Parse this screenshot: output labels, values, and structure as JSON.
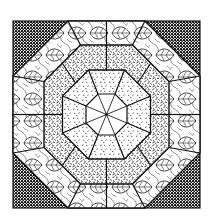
{
  "image": {
    "description": "Black-and-white octagonal quilt block illustration",
    "background": "#ffffff",
    "colors": {
      "ink": "#1a1a1a",
      "corner_fill": "#2b2b2b",
      "paper": "#ffffff"
    },
    "block": {
      "x": 13,
      "y": 21,
      "size": 187,
      "center": [
        106.5,
        114.5
      ]
    },
    "regions": [
      {
        "name": "corner-triangles",
        "pattern": "dense-dots"
      },
      {
        "name": "outer-octagon-ring",
        "pattern": "leaf-print"
      },
      {
        "name": "middle-octagon-ring",
        "pattern": "dark-speckle"
      },
      {
        "name": "inner-octagon-ring",
        "pattern": "light-speckle"
      },
      {
        "name": "center-octagon",
        "pattern": "plain-white-with-8-spokes"
      }
    ]
  }
}
